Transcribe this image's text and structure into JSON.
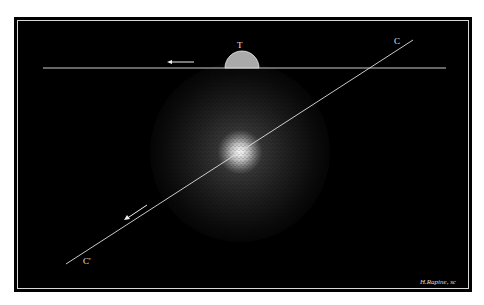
{
  "engraving": {
    "labels": {
      "earth": "T",
      "axis_top": "C",
      "axis_bottom": "C'"
    },
    "signature": "H.Rapine, sc",
    "colors": {
      "background": "#000000",
      "lines": "#e0e0e0",
      "glow": "#ffffff"
    }
  }
}
